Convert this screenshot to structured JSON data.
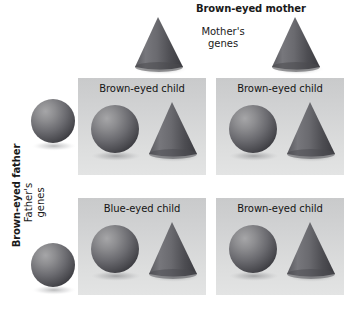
{
  "figure": {
    "type": "punnett-square"
  },
  "header": {
    "mother_title": "Brown-eyed mother",
    "mother_genes_line1": "Mother's",
    "mother_genes_line2": "genes",
    "father_title": "Brown-eyed father",
    "father_genes_line1": "Father's",
    "father_genes_line2": "genes"
  },
  "symbols": {
    "mother_gene": "cone",
    "father_gene": "sphere",
    "sphere_icon": "sphere-icon",
    "cone_icon": "cone-icon"
  },
  "parent_gametes": {
    "mother": [
      {
        "icon": "cone-icon",
        "name": "mother-gamete-1"
      },
      {
        "icon": "cone-icon",
        "name": "mother-gamete-2"
      }
    ],
    "father": [
      {
        "icon": "sphere-icon",
        "name": "father-gamete-1"
      },
      {
        "icon": "sphere-icon",
        "name": "father-gamete-2"
      }
    ]
  },
  "cells": [
    {
      "id": "cell-top-left",
      "label": "Brown-eyed child",
      "row": 0,
      "column": 0,
      "father_gene": "sphere",
      "mother_gene": "cone"
    },
    {
      "id": "cell-top-right",
      "label": "Brown-eyed child",
      "row": 0,
      "column": 1,
      "father_gene": "sphere",
      "mother_gene": "cone"
    },
    {
      "id": "cell-bottom-left",
      "label": "Blue-eyed child",
      "row": 1,
      "column": 0,
      "father_gene": "sphere",
      "mother_gene": "cone"
    },
    {
      "id": "cell-bottom-right",
      "label": "Brown-eyed child",
      "row": 1,
      "column": 1,
      "father_gene": "sphere",
      "mother_gene": "cone"
    }
  ],
  "colors": {
    "cell_background_top": "#c9cacb",
    "cell_background_bottom": "#e3e4e4",
    "shape_light": "#9a9a9c",
    "shape_mid": "#6e6e72",
    "shape_dark": "#3c3c40",
    "text": "#141414",
    "page_background": "#ffffff"
  }
}
